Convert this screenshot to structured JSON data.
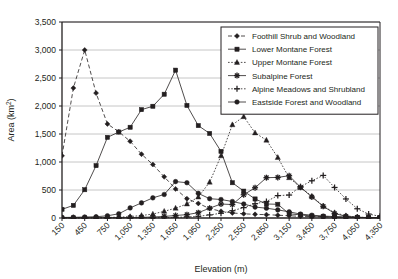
{
  "chart_data": {
    "type": "line",
    "title": "",
    "xlabel": "Elevation (m)",
    "ylabel": "Area (km2)",
    "ylabel_display": "Area (km",
    "ylabel_sup": "2",
    "ylabel_tail": ")",
    "xlim": [
      150,
      4350
    ],
    "ylim": [
      0,
      3500
    ],
    "grid": true,
    "legend_position": "top-right",
    "categories": [
      150,
      300,
      450,
      600,
      750,
      900,
      1050,
      1200,
      1350,
      1500,
      1650,
      1800,
      1950,
      2100,
      2250,
      2400,
      2550,
      2700,
      2850,
      3000,
      3150,
      3300,
      3450,
      3600,
      3750,
      3900,
      4050,
      4200,
      4350
    ],
    "xticks": [
      "150",
      "450",
      "750",
      "1,050",
      "1,350",
      "1,650",
      "1,950",
      "2,250",
      "2,550",
      "2,850",
      "3,150",
      "3,450",
      "3,750",
      "4,050",
      "4,350"
    ],
    "yticks": [
      "0",
      "500",
      "1,000",
      "1,500",
      "2,000",
      "2,500",
      "3,000",
      "3,500"
    ],
    "series": [
      {
        "name": "Foothill Shrub and Woodland",
        "marker": "diamond",
        "line": "dashed",
        "values": [
          1110,
          2320,
          3000,
          2230,
          1680,
          1540,
          1370,
          1140,
          955,
          735,
          520,
          345,
          260,
          170,
          120,
          90,
          75,
          65,
          60,
          50,
          40,
          30,
          25,
          20,
          15,
          12,
          10,
          8,
          5
        ]
      },
      {
        "name": "Lower Montane Forest",
        "marker": "square",
        "line": "solid",
        "values": [
          155,
          225,
          505,
          935,
          1440,
          1535,
          1620,
          1935,
          1995,
          2210,
          2640,
          2010,
          1650,
          1510,
          1190,
          630,
          480,
          340,
          250,
          245,
          75,
          55,
          35,
          25,
          15,
          10,
          8,
          5,
          5
        ]
      },
      {
        "name": "Upper Montane Forest",
        "marker": "triangle",
        "line": "dotted",
        "values": [
          5,
          5,
          5,
          8,
          10,
          15,
          25,
          45,
          70,
          120,
          175,
          250,
          375,
          640,
          1110,
          1665,
          1810,
          1520,
          1390,
          1080,
          720,
          545,
          390,
          210,
          95,
          40,
          15,
          8,
          5
        ]
      },
      {
        "name": "Subalpine Forest",
        "marker": "star",
        "line": "solid",
        "values": [
          2,
          2,
          2,
          3,
          4,
          5,
          8,
          12,
          18,
          28,
          45,
          60,
          95,
          175,
          250,
          240,
          415,
          540,
          720,
          725,
          755,
          550,
          375,
          210,
          80,
          30,
          12,
          6,
          4
        ]
      },
      {
        "name": "Alpine Meadows and Shrubland",
        "marker": "plus",
        "line": "dotted",
        "values": [
          1,
          1,
          1,
          1,
          2,
          2,
          3,
          4,
          6,
          8,
          12,
          18,
          30,
          55,
          85,
          130,
          185,
          255,
          295,
          400,
          410,
          560,
          665,
          760,
          545,
          340,
          165,
          70,
          30
        ]
      },
      {
        "name": "Eastside Forest and Woodland",
        "marker": "circle",
        "line": "solid",
        "values": [
          10,
          12,
          18,
          22,
          40,
          75,
          180,
          270,
          360,
          420,
          650,
          630,
          440,
          345,
          330,
          295,
          250,
          195,
          175,
          145,
          110,
          70,
          50,
          35,
          25,
          18,
          12,
          8,
          5
        ]
      }
    ]
  },
  "colors": {
    "axis": "#231f20",
    "grid": "#b8b8b8",
    "series": "#231f20",
    "legend_border": "#231f20",
    "background": "#ffffff"
  }
}
